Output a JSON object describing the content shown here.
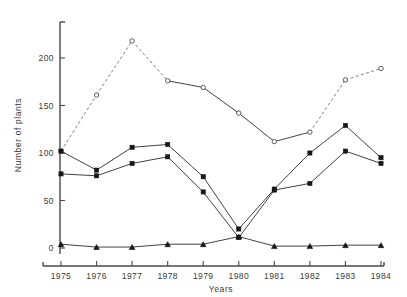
{
  "chart_data": {
    "type": "line",
    "title": "",
    "xlabel": "Years",
    "ylabel": "Number of plants",
    "categories": [
      "1975",
      "1976",
      "1977",
      "1978",
      "1979",
      "1980",
      "1981",
      "1982",
      "1983",
      "1984"
    ],
    "x": [
      1975,
      1976,
      1977,
      1978,
      1979,
      1980,
      1981,
      1982,
      1983,
      1984
    ],
    "xlim": [
      1975,
      1984
    ],
    "ylim": [
      0,
      220
    ],
    "ytick_labels": [
      "0",
      "50",
      "100",
      "150",
      "200"
    ],
    "ytick_values": [
      0,
      50,
      100,
      150,
      200
    ],
    "xtick_labels": [
      "1975",
      "1976",
      "1977",
      "1978",
      "1979",
      "1980",
      "1981",
      "1982",
      "1983",
      "1984"
    ],
    "grid": false,
    "legend": "none",
    "series": [
      {
        "name": "open-circle-series",
        "marker": "open-circle",
        "line_style": "mixed-dashed",
        "dashed_segments": [
          [
            0,
            1
          ],
          [
            1,
            2
          ],
          [
            2,
            3
          ],
          [
            7,
            8
          ],
          [
            8,
            9
          ]
        ],
        "values": [
          102,
          161,
          218,
          176,
          169,
          142,
          112,
          122,
          177,
          189
        ]
      },
      {
        "name": "filled-square-series-upper",
        "marker": "filled-square",
        "line_style": "solid",
        "values": [
          102,
          82,
          106,
          109,
          75,
          20,
          62,
          100,
          129,
          95
        ]
      },
      {
        "name": "filled-square-series-lower",
        "marker": "filled-square",
        "line_style": "solid",
        "values": [
          78,
          76,
          89,
          96,
          59,
          11,
          61,
          68,
          102,
          89
        ]
      },
      {
        "name": "filled-triangle-series",
        "marker": "filled-triangle",
        "line_style": "solid",
        "values": [
          4,
          1,
          1,
          4,
          4,
          12,
          2,
          2,
          3,
          3
        ]
      }
    ]
  },
  "colors": {
    "axis": "#4a4a4a",
    "solid_line": "#2b2b2b",
    "dashed_line": "#6f6f6f",
    "marker_fill": "#161616",
    "open_marker_fill": "#ffffff",
    "background": "#ffffff"
  }
}
